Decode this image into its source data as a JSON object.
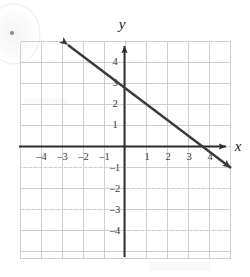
{
  "figure": {
    "kind": "coordinate-plane-graph",
    "background_color": "#ffffff"
  },
  "axes": {
    "x_axis_label": "x",
    "y_axis_label": "y",
    "axis_color": "#2b2b2b",
    "grid_color": "#c8c8cc",
    "x_range": [
      -5,
      5
    ],
    "y_range": [
      -5,
      5
    ],
    "x_tick_labels": [
      "–4",
      "–3",
      "–2",
      "–1",
      "1",
      "2",
      "3",
      "4"
    ],
    "x_tick_values": [
      -4,
      -3,
      -2,
      -1,
      1,
      2,
      3,
      4
    ],
    "y_tick_labels": [
      "4",
      "3",
      "2",
      "1",
      "–1",
      "–2",
      "–3",
      "–4"
    ],
    "y_tick_values": [
      4,
      3,
      2,
      1,
      -1,
      -2,
      -3,
      -4
    ],
    "origin_label": ""
  },
  "plotted_line": {
    "name": "line",
    "color": "#333333",
    "y_intercept": 3,
    "x_intercept": 4,
    "slope": -0.75,
    "equation": "y = -3/4x + 3",
    "arrowheads": "both",
    "endpoint_start": [
      -1.9,
      4.4
    ],
    "endpoint_end": [
      5.1,
      -0.8
    ]
  },
  "marks": {
    "bullet_dot": "•",
    "bullet_note": "partial ink circle with dot at top-left margin"
  }
}
